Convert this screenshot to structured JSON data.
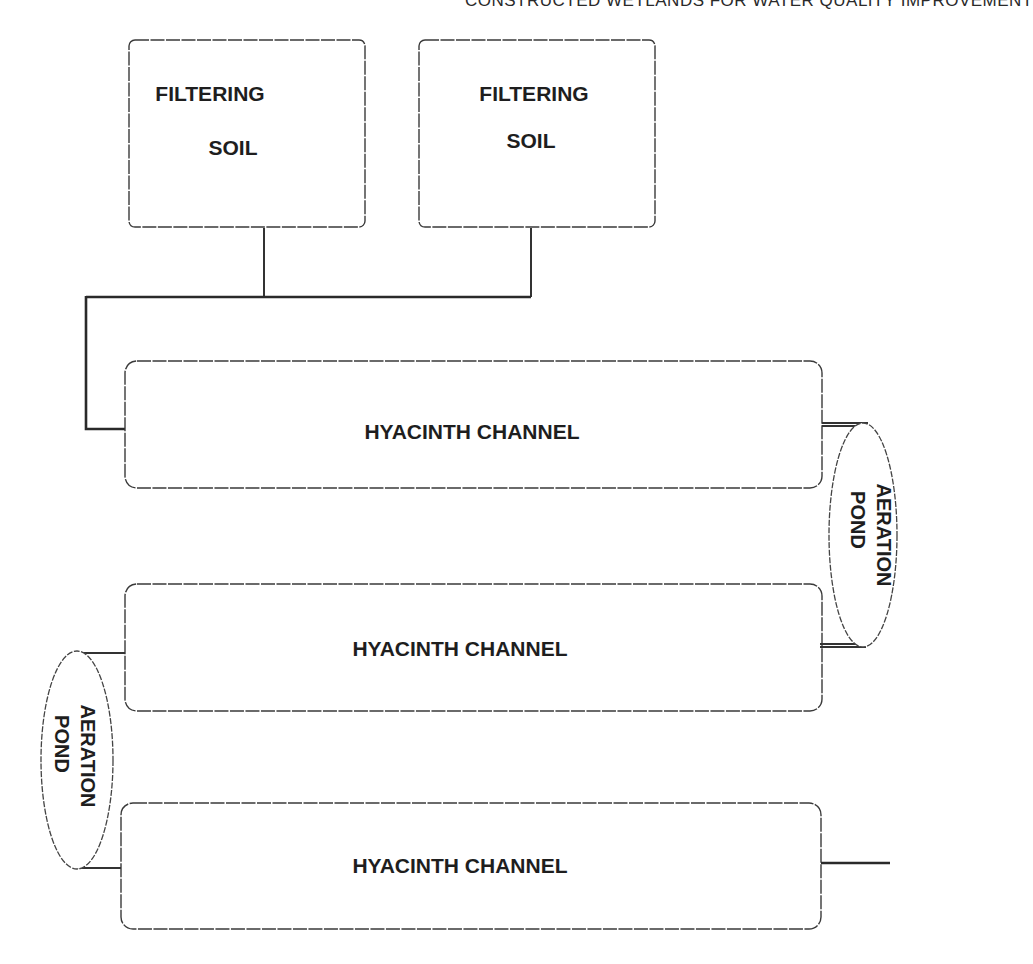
{
  "header": {
    "running_title": "CONSTRUCTED WETLANDS FOR WATER QUALITY IMPROVEMENT"
  },
  "diagram": {
    "filters": [
      {
        "line1": "FILTERING",
        "line2": "SOIL"
      },
      {
        "line1": "FILTERING",
        "line2": "SOIL"
      }
    ],
    "channels": [
      {
        "label": "HYACINTH CHANNEL"
      },
      {
        "label": "HYACINTH CHANNEL"
      },
      {
        "label": "HYACINTH CHANNEL"
      }
    ],
    "ponds": [
      {
        "line1": "AERATION",
        "line2": "POND",
        "side": "right"
      },
      {
        "line1": "AERATION",
        "line2": "POND",
        "side": "left"
      }
    ]
  }
}
